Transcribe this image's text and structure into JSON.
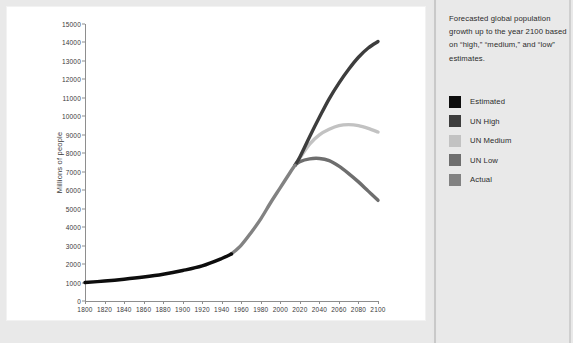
{
  "caption": "Forecasted global population growth up to the year 2100 based on “high,” “medium,” and “low” estimates.",
  "legend": {
    "items": [
      {
        "label": "Estimated",
        "color": "#0d0d0d"
      },
      {
        "label": "UN High",
        "color": "#3d3d3d"
      },
      {
        "label": "UN Medium",
        "color": "#c2c2c2"
      },
      {
        "label": "UN Low",
        "color": "#6e6e6e"
      },
      {
        "label": "Actual",
        "color": "#828282"
      }
    ]
  },
  "chart_data": {
    "type": "line",
    "title": "",
    "xlabel": "",
    "ylabel": "Millions of people",
    "xlim": [
      1800,
      2100
    ],
    "ylim": [
      0,
      15000
    ],
    "xticks": [
      1800,
      1820,
      1840,
      1860,
      1880,
      1900,
      1920,
      1940,
      1960,
      1980,
      2000,
      2020,
      2040,
      2060,
      2080,
      2100
    ],
    "yticks": [
      0,
      1000,
      2000,
      3000,
      4000,
      5000,
      6000,
      7000,
      8000,
      9000,
      10000,
      11000,
      12000,
      13000,
      14000,
      15000
    ],
    "grid": false,
    "legend_position": "right",
    "series": [
      {
        "name": "Estimated",
        "color": "#0d0d0d",
        "x": [
          1800,
          1820,
          1840,
          1860,
          1880,
          1900,
          1920,
          1940,
          1950
        ],
        "values": [
          1000,
          1080,
          1180,
          1300,
          1450,
          1650,
          1900,
          2300,
          2550
        ]
      },
      {
        "name": "Actual",
        "color": "#828282",
        "x": [
          1950,
          1960,
          1970,
          1980,
          1990,
          2000,
          2010,
          2015
        ],
        "values": [
          2550,
          3030,
          3700,
          4450,
          5320,
          6140,
          6960,
          7350
        ]
      },
      {
        "name": "UN High",
        "color": "#3d3d3d",
        "x": [
          2015,
          2020,
          2030,
          2040,
          2050,
          2060,
          2070,
          2080,
          2090,
          2100
        ],
        "values": [
          7350,
          7800,
          8900,
          9950,
          10950,
          11800,
          12550,
          13200,
          13700,
          14050
        ]
      },
      {
        "name": "UN Medium",
        "color": "#c2c2c2",
        "x": [
          2015,
          2020,
          2030,
          2040,
          2050,
          2060,
          2070,
          2080,
          2090,
          2100
        ],
        "values": [
          7350,
          7750,
          8500,
          9000,
          9300,
          9500,
          9550,
          9500,
          9350,
          9150
        ]
      },
      {
        "name": "UN Low",
        "color": "#6e6e6e",
        "x": [
          2015,
          2020,
          2030,
          2040,
          2050,
          2060,
          2070,
          2080,
          2090,
          2100
        ],
        "values": [
          7350,
          7550,
          7700,
          7720,
          7600,
          7300,
          6900,
          6450,
          5950,
          5450
        ]
      }
    ]
  }
}
